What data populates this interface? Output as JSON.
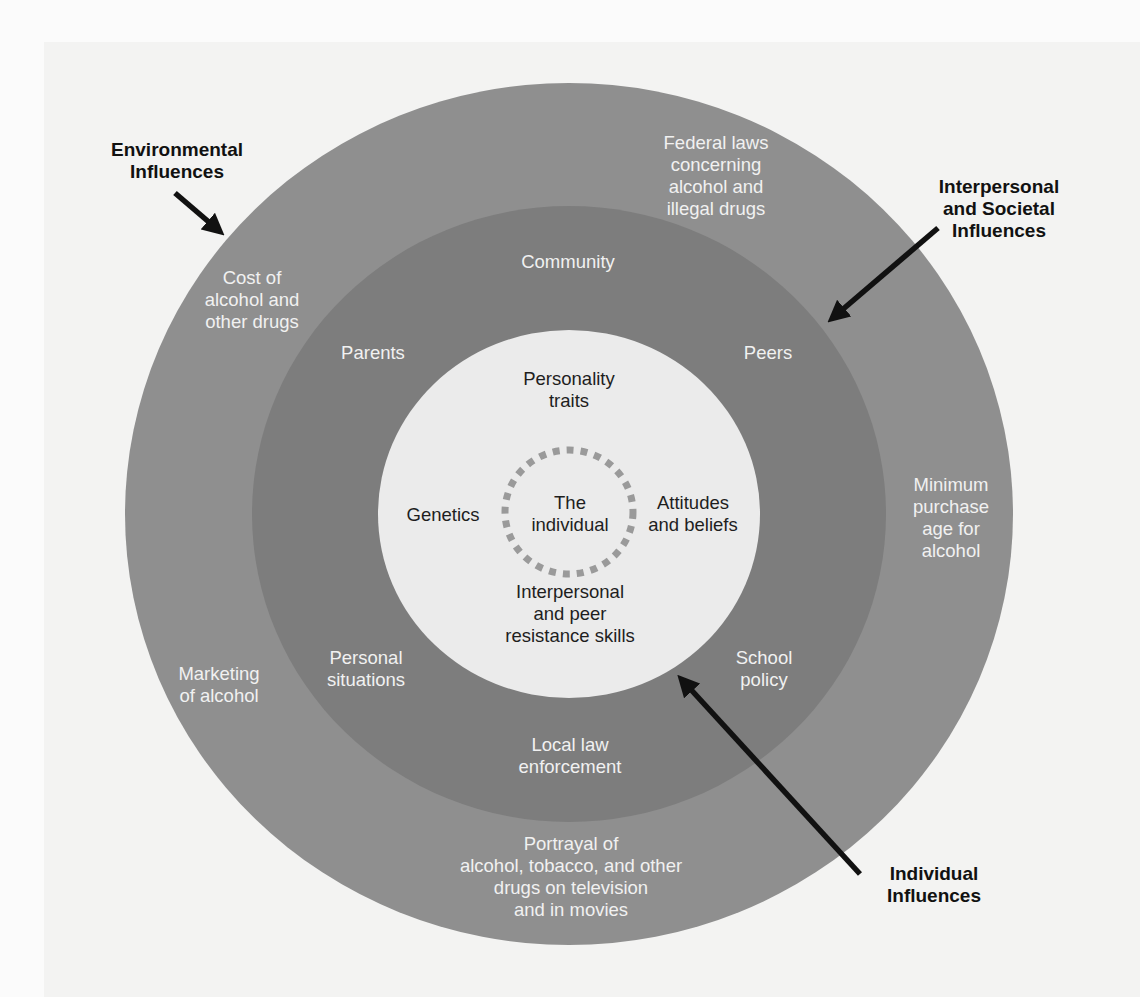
{
  "diagram": {
    "type": "concentric-circles",
    "colors": {
      "page_background": "#fbfbfb",
      "outer_ring": "#8f8f8f",
      "middle_ring": "#7d7d7d",
      "inner_circle": "#ebebeb",
      "dashed_ring": "#999999",
      "arrow": "#111111",
      "ring_text": "#f1f1f1",
      "inner_text": "#1e1e1e"
    },
    "rings": {
      "outer": {
        "name": "Environmental Influences",
        "items": [
          "Federal laws\nconcerning\nalcohol and\nillegal drugs",
          "Cost of\nalcohol and\nother drugs",
          "Minimum\npurchase\nage for\nalcohol",
          "Marketing\nof alcohol",
          "Portrayal of\nalcohol, tobacco, and other\ndrugs on television\nand in movies"
        ]
      },
      "middle": {
        "name": "Interpersonal and Societal Influences",
        "items": [
          "Community",
          "Parents",
          "Peers",
          "Personal\nsituations",
          "School\npolicy",
          "Local law\nenforcement"
        ]
      },
      "inner": {
        "name": "Individual Influences",
        "items": [
          "Personality\ntraits",
          "Genetics",
          "Attitudes\nand beliefs",
          "Interpersonal\nand peer\nresistance skills"
        ]
      },
      "center": {
        "label": "The\nindividual"
      }
    },
    "callouts": [
      {
        "label": "Environmental\nInfluences"
      },
      {
        "label": "Interpersonal\nand Societal\nInfluences"
      },
      {
        "label": "Individual\nInfluences"
      }
    ]
  }
}
